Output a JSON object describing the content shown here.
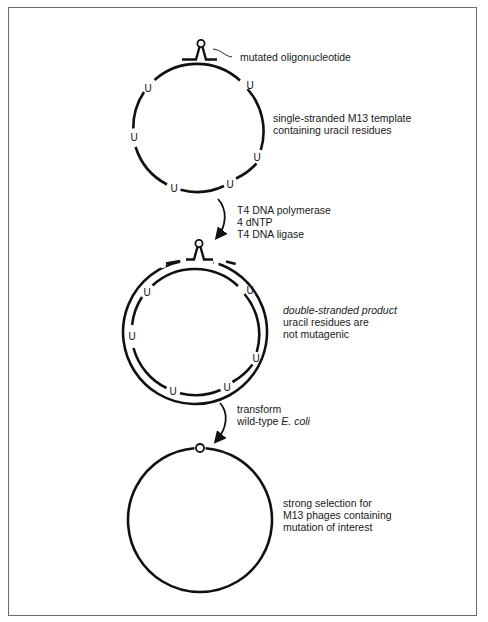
{
  "diagram": {
    "title": "",
    "stages": [
      {
        "id": "template",
        "callout": "mutated oligonucleotide",
        "description_lines": [
          "single-stranded M13 template",
          "containing uracil residues"
        ],
        "residue_label": "U",
        "residue_count": 6
      },
      {
        "id": "double-stranded",
        "description_lines": [
          {
            "text": "double-stranded product",
            "italic": true
          },
          {
            "text": "uracil residues are",
            "italic": false
          },
          {
            "text": "not mutagenic",
            "italic": false
          }
        ],
        "residue_label": "U",
        "residue_count": 6
      },
      {
        "id": "selection",
        "description_lines": [
          "strong selection for",
          "M13 phages containing",
          "mutation of interest"
        ]
      }
    ],
    "steps": [
      {
        "id": "step-1",
        "lines": [
          "T4 DNA polymerase",
          "4 dNTP",
          "T4 DNA ligase"
        ]
      },
      {
        "id": "step-2",
        "line1": "transform",
        "line2_prefix": "wild-type ",
        "line2_italic": "E. coli"
      }
    ],
    "colors": {
      "stroke": "#111111",
      "frame": "#6b6b6b",
      "text": "#1a1a1a",
      "background": "#ffffff"
    }
  }
}
